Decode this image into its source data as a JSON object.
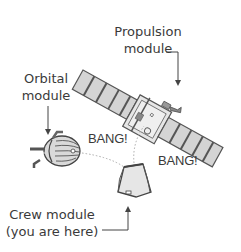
{
  "diagram": {
    "labels": {
      "propulsion_line1": "Propulsion",
      "propulsion_line2": "module",
      "orbital_line1": "Orbital",
      "orbital_line2": "module",
      "crew_line1": "Crew module",
      "crew_line2": "(you are here)"
    },
    "bangs": {
      "bang_left": "BANG!",
      "bang_right": "BANG!"
    },
    "colors": {
      "panel_fill": "#d4d4d4",
      "stroke": "#555555",
      "text": "#3a3a3a",
      "dotted_path": "#aaaaaa"
    }
  }
}
